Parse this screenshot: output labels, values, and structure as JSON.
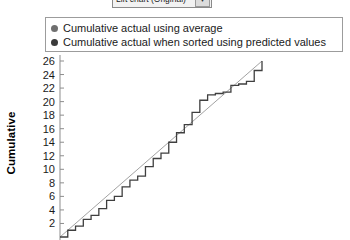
{
  "toolbar": {
    "chart_type_select": {
      "value": "Lift chart (Original)",
      "arrow_icon": "chevron-down-icon",
      "arrow_glyph": "▼"
    }
  },
  "legend": {
    "entries": [
      {
        "label": "Cumulative actual using average",
        "color": "#6f6f6f",
        "marker": "circle"
      },
      {
        "label": "Cumulative actual when sorted using predicted values",
        "color": "#3a3a3a",
        "marker": "circle"
      }
    ],
    "border_color": "#9c9c9c"
  },
  "chart_data": {
    "type": "line",
    "title": "",
    "subtitle": "",
    "xlabel": "",
    "ylabel": "Cumulative",
    "xlim": [
      0,
      26
    ],
    "ylim": [
      0,
      26
    ],
    "grid": false,
    "legend_position": "top",
    "y_ticks": [
      2,
      4,
      6,
      8,
      10,
      12,
      14,
      16,
      18,
      20,
      22,
      24,
      26
    ],
    "y_tick_labels": [
      "2",
      "4",
      "6",
      "8",
      "10",
      "12",
      "14",
      "16",
      "18",
      "20",
      "22",
      "24",
      "26"
    ],
    "x_ticks": [],
    "x_tick_labels": [],
    "axis_color": "#8d8d8d",
    "series": [
      {
        "name": "Cumulative actual using average",
        "color": "#8a8a8a",
        "width": 0.8,
        "style": "straight",
        "x": [
          0,
          26
        ],
        "values": [
          0,
          26
        ]
      },
      {
        "name": "Cumulative actual when sorted using predicted values",
        "color": "#3f3f3f",
        "width": 1.3,
        "style": "step",
        "x": [
          0,
          1,
          2,
          3,
          4,
          5,
          6,
          7,
          8,
          9,
          10,
          11,
          12,
          13,
          14,
          15,
          16,
          17,
          18,
          19,
          20,
          21,
          22,
          23,
          24,
          25,
          26
        ],
        "values": [
          0,
          1.0,
          1.6,
          2.6,
          3.2,
          4.2,
          5.4,
          6.0,
          7.4,
          8.4,
          9.0,
          10.4,
          11.6,
          12.4,
          14.0,
          15.4,
          16.6,
          18.4,
          20.2,
          21.0,
          21.2,
          21.4,
          22.4,
          22.6,
          23.0,
          24.6,
          26.0
        ]
      }
    ]
  }
}
